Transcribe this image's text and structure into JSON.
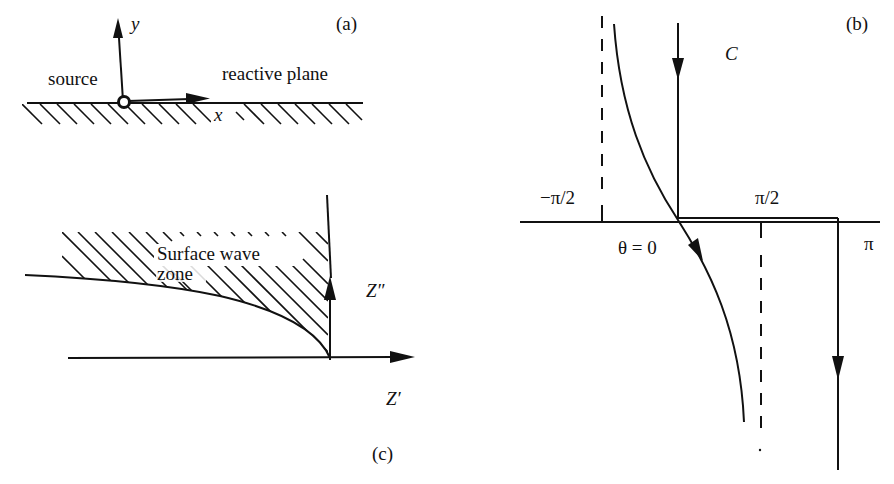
{
  "panels": {
    "a": {
      "tag": "(a)",
      "y_axis": "y",
      "x_axis": "x",
      "source_label": "source",
      "plane_label": "reactive plane"
    },
    "b": {
      "tag": "(b)",
      "contour_label": "C",
      "neg_half_pi": "−π/2",
      "half_pi": "π/2",
      "pi": "π",
      "theta_zero": "θ = 0"
    },
    "c": {
      "tag": "(c)",
      "zone_line1": "Surface wave",
      "zone_line2": "zone",
      "imag_axis": "Z″",
      "real_axis": "Z′"
    }
  },
  "colors": {
    "ink": "#111111",
    "background": "#ffffff"
  }
}
